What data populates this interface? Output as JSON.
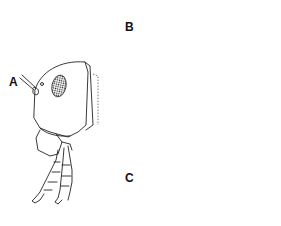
{
  "figure": {
    "panels": [
      {
        "id": "A",
        "label": "A",
        "view": "frontal view of head"
      },
      {
        "id": "B",
        "label": "B",
        "view": "lateral view of head"
      },
      {
        "id": "C",
        "label": "C",
        "view": "dorsal view of head"
      }
    ],
    "colors": {
      "line": "#222222",
      "background": "#ffffff"
    }
  }
}
